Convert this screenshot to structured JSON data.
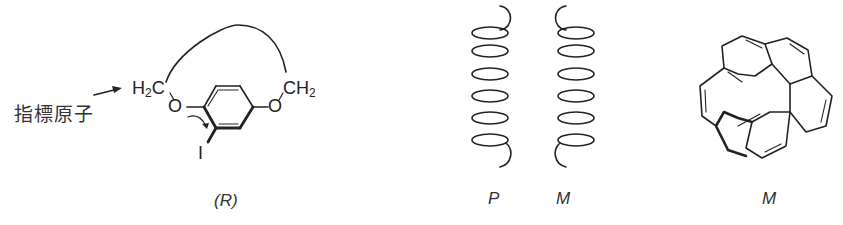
{
  "panels": [
    {
      "id": "indicator-atom",
      "annotation": "指標原子",
      "atoms": {
        "left_ch2": "H",
        "left_ch2_sub": "2",
        "left_ch2_c": "C",
        "o_left": "O",
        "o_right": "O",
        "right_ch2": "CH",
        "right_ch2_sub": "2",
        "iodine": "I"
      },
      "label": "(R)"
    },
    {
      "id": "helices",
      "labels": [
        "P",
        "M"
      ]
    },
    {
      "id": "helicene",
      "label": "M"
    }
  ],
  "colors": {
    "stroke": "#222222",
    "text": "#333333",
    "background": "#ffffff"
  }
}
